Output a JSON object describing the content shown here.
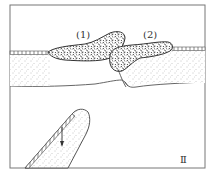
{
  "figure": {
    "labels": {
      "block1": "(1)",
      "block2": "(2)",
      "panel": "Ⅱ"
    },
    "colors": {
      "line": "#555555",
      "frame": "#777777",
      "stipple": "#888888",
      "breccia": "#333333",
      "background": "#ffffff"
    }
  }
}
